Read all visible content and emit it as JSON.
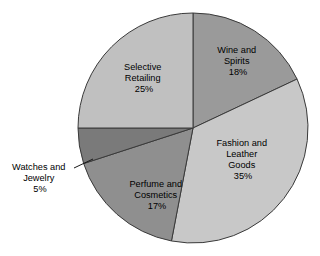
{
  "chart_data": {
    "type": "pie",
    "title": "",
    "subtitle": "",
    "xlabel": "",
    "ylabel": "",
    "legend_position": "none",
    "grid": false,
    "start_angle_deg": 0,
    "direction": "clockwise",
    "categories": [
      "Wine and Spirits",
      "Fashion and Leather Goods",
      "Perfume and Cosmetics",
      "Watches and Jewelry",
      "Selective Retailing"
    ],
    "values": [
      18,
      35,
      17,
      5,
      25
    ],
    "value_unit": "%",
    "slices": [
      {
        "id": "wine-and-spirits",
        "label_lines": [
          "Wine and",
          "Spirits"
        ],
        "value": 18,
        "value_text": "18%",
        "color": "#9a9a9a",
        "label_x": 238,
        "label_y": 62,
        "callout": false
      },
      {
        "id": "fashion-and-leather-goods",
        "label_lines": [
          "Fashion and",
          "Leather",
          "Goods"
        ],
        "value": 35,
        "value_text": "35%",
        "color": "#c8c8c8",
        "label_x": 243,
        "label_y": 160,
        "callout": false
      },
      {
        "id": "perfume-and-cosmetics",
        "label_lines": [
          "Perfume and",
          "Cosmetics"
        ],
        "value": 17,
        "value_text": "17%",
        "color": "#8f8f8f",
        "label_x": 157,
        "label_y": 193,
        "callout": false
      },
      {
        "id": "watches-and-jewelry",
        "label_lines": [
          "Watches and",
          "Jewelry"
        ],
        "value": 5,
        "value_text": "5%",
        "color": "#7a7a7a",
        "label_x": 38,
        "label_y": 176,
        "callout": true
      },
      {
        "id": "selective-retailing",
        "label_lines": [
          "Selective",
          "Retailing"
        ],
        "value": 25,
        "value_text": "25%",
        "color": "#c0c0c0",
        "label_x": 144,
        "label_y": 78,
        "callout": false
      }
    ],
    "geometry": {
      "center_x": 193,
      "center_y": 128,
      "radius": 115
    },
    "style": {
      "background": "#ffffff",
      "outline_color": "#3a3a3a",
      "text_color": "#000000",
      "leader_line_color": "#1a1a1a"
    },
    "leader_line": {
      "x1": 74,
      "y1": 168,
      "x2": 93,
      "y2": 159
    }
  },
  "labels": {
    "wine_l1": "Wine and",
    "wine_l2": "Spirits",
    "wine_pct": "18%",
    "fashion_l1": "Fashion and",
    "fashion_l2": "Leather",
    "fashion_l3": "Goods",
    "fashion_pct": "35%",
    "perfume_l1": "Perfume and",
    "perfume_l2": "Cosmetics",
    "perfume_pct": "17%",
    "watches_l1": "Watches and",
    "watches_l2": "Jewelry",
    "watches_pct": "5%",
    "selective_l1": "Selective",
    "selective_l2": "Retailing",
    "selective_pct": "25%"
  }
}
